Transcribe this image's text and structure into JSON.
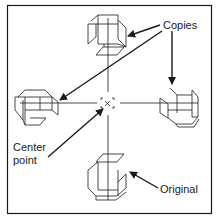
{
  "labels": {
    "copies": "Copies",
    "center_line1": "Center",
    "center_line2": "point",
    "original": "Original"
  },
  "colors": {
    "ink": "#1a1a1a",
    "background": "#ffffff"
  }
}
